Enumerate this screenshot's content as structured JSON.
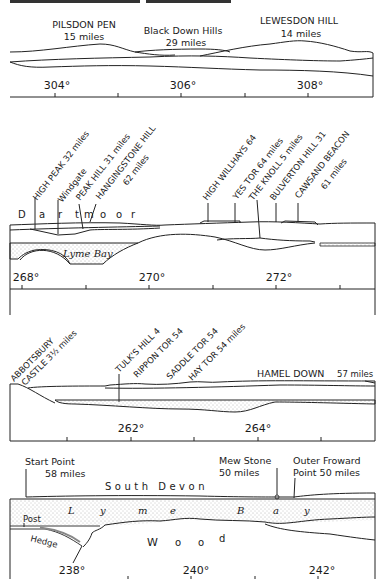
{
  "panels": [
    {
      "id": "panel-1",
      "labels": [
        {
          "name": "pilsdon-pen",
          "line1": "PILSDON PEN",
          "line2": "15 miles"
        },
        {
          "name": "black-down-hills",
          "line1": "Black Down Hills",
          "line2": "29 miles"
        },
        {
          "name": "lewesdon-hill",
          "line1": "LEWESDON HILL",
          "line2": "14 miles"
        }
      ],
      "degrees": [
        "304°",
        "306°",
        "308°"
      ]
    },
    {
      "id": "panel-2",
      "labels": [
        {
          "name": "high-peak",
          "text": "HIGH PEAK 32 miles"
        },
        {
          "name": "windgate",
          "text": "Windgate"
        },
        {
          "name": "peak-hill",
          "text": "PEAK HILL 31 miles"
        },
        {
          "name": "hangingstone-hill",
          "line1": "HANGINGSTONE HILL",
          "line2": "62 miles"
        },
        {
          "name": "high-willhays",
          "text": "HIGH WILLHAYS 64"
        },
        {
          "name": "yes-tor",
          "text": "YES TOR 64 miles"
        },
        {
          "name": "the-knoll",
          "text": "THE KNOLL 5 miles"
        },
        {
          "name": "bulverton-hill",
          "text": "BULVERTON HILL 31"
        },
        {
          "name": "cawsand-beacon",
          "line1": "CAWSAND BEACON",
          "line2": "61 miles"
        }
      ],
      "region_labels": {
        "dartmoor": [
          "D",
          "a",
          "r",
          "t",
          "m",
          "o",
          "o",
          "r"
        ],
        "lyme_bay": "Lyme Bay"
      },
      "degrees": [
        "268°",
        "270°",
        "272°"
      ]
    },
    {
      "id": "panel-3",
      "labels": [
        {
          "name": "abbotsbury-castle",
          "line1": "ABBOTSBURY",
          "line2": "CASTLE 3½ miles"
        },
        {
          "name": "tulks-hill",
          "text": "TULK'S HILL 4"
        },
        {
          "name": "rippon-tor",
          "text": "RIPPON TOR 54"
        },
        {
          "name": "saddle-tor",
          "text": "SADDLE TOR 54"
        },
        {
          "name": "hay-tor",
          "text": "HAY TOR 54 miles"
        },
        {
          "name": "hamel-down",
          "text": "HAMEL DOWN",
          "dist": "57 miles"
        }
      ],
      "degrees": [
        "262°",
        "264°"
      ]
    },
    {
      "id": "panel-4",
      "labels": [
        {
          "name": "start-point",
          "line1": "Start Point",
          "line2": "58 miles"
        },
        {
          "name": "mew-stone",
          "line1": "Mew Stone",
          "line2": "50 miles"
        },
        {
          "name": "outer-froward-point",
          "line1": "Outer Froward",
          "line2": "Point 50 miles"
        }
      ],
      "region_labels": {
        "south_devon": "South Devon",
        "lyme_bay": [
          "L",
          "y",
          "m",
          "e",
          "B",
          "a",
          "y"
        ],
        "wood": [
          "W",
          "o",
          "o",
          "d"
        ],
        "post": "Post",
        "hedge": "Hedge"
      },
      "degrees": [
        "238°",
        "240°",
        "242°"
      ]
    }
  ]
}
